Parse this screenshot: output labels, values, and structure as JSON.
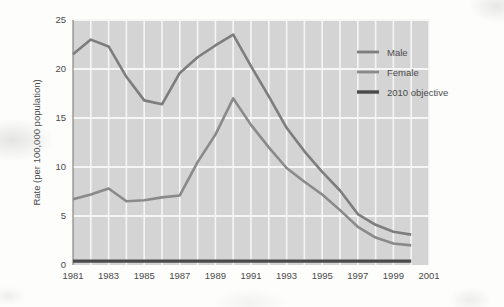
{
  "chart_data": {
    "type": "line",
    "title": "",
    "xlabel": "",
    "ylabel": "Rate (per 100,000 population)",
    "xlim": [
      1981,
      2001
    ],
    "ylim": [
      0,
      25
    ],
    "grid": true,
    "legend_position": "top-right",
    "y_ticks": [
      0,
      5,
      10,
      15,
      20,
      25
    ],
    "y_tick_labels": [
      "0",
      "5",
      "10",
      "15",
      "20",
      "25"
    ],
    "x_ticks": [
      1981,
      1983,
      1985,
      1987,
      1989,
      1991,
      1993,
      1995,
      1997,
      1999,
      2001
    ],
    "x_tick_labels": [
      "1981",
      "1983",
      "1985",
      "1987",
      "1989",
      "1991",
      "1993",
      "1995",
      "1997",
      "1999",
      "2001"
    ],
    "x": [
      1981,
      1982,
      1983,
      1984,
      1985,
      1986,
      1987,
      1988,
      1989,
      1990,
      1991,
      1992,
      1993,
      1994,
      1995,
      1996,
      1997,
      1998,
      1999,
      2000
    ],
    "series": [
      {
        "name": "Male",
        "color": "#7d7d7d",
        "values": [
          21.5,
          23.0,
          22.3,
          19.2,
          16.8,
          16.4,
          19.6,
          21.2,
          22.4,
          23.5,
          20.3,
          17.2,
          14.0,
          11.6,
          9.5,
          7.6,
          5.2,
          4.1,
          3.4,
          3.1
        ]
      },
      {
        "name": "Female",
        "color": "#8a8a8a",
        "values": [
          6.7,
          7.2,
          7.8,
          6.5,
          6.6,
          6.9,
          7.1,
          10.5,
          13.3,
          17.0,
          14.3,
          12.0,
          9.9,
          8.5,
          7.2,
          5.6,
          3.9,
          2.8,
          2.2,
          2.0
        ]
      },
      {
        "name": "2010 objective",
        "color": "#4a4a4a",
        "values": [
          0.4,
          0.4,
          0.4,
          0.4,
          0.4,
          0.4,
          0.4,
          0.4,
          0.4,
          0.4,
          0.4,
          0.4,
          0.4,
          0.4,
          0.4,
          0.4,
          0.4,
          0.4,
          0.4,
          0.4
        ]
      }
    ],
    "legend": [
      {
        "label": "Male",
        "color": "#7d7d7d"
      },
      {
        "label": "Female",
        "color": "#8a8a8a"
      },
      {
        "label": "2010 objective",
        "color": "#4a4a4a"
      }
    ],
    "plot_background": "#d4d4d4",
    "gridline_color": "#f5f5f5"
  }
}
